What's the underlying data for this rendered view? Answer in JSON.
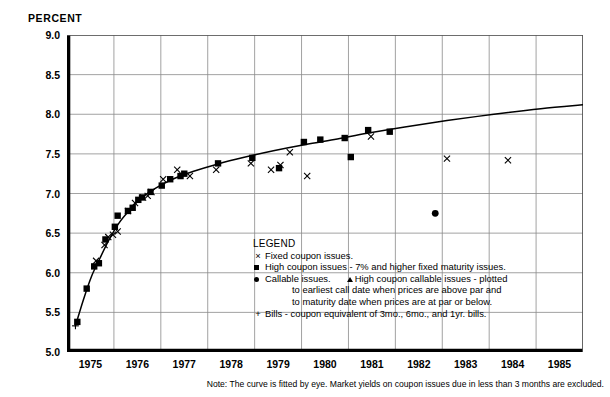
{
  "axis_caption": "PERCENT",
  "note": "Note: The curve is fitted by eye. Market yields on coupon issues due in less than 3 months are excluded.",
  "legend": {
    "title": "LEGEND",
    "items": [
      {
        "marker": "x-cross",
        "text": "Fixed coupon issues."
      },
      {
        "marker": "square",
        "text": "High coupon issues - 7% and higher fixed maturity issues."
      },
      {
        "marker": "circle",
        "text": "Callable issues."
      },
      {
        "marker": "triangle",
        "text": "High coupon callable issues - plotted"
      },
      {
        "marker": "none",
        "text": "to earliest call date when prices are above par and"
      },
      {
        "marker": "none",
        "text": "to maturity date when prices are at par or below."
      },
      {
        "marker": "plus",
        "text": "Bills - coupon equivalent of 3mo., 6mo., and 1yr. bills."
      }
    ]
  },
  "chart_data": {
    "type": "scatter",
    "title": "",
    "subtitle": "",
    "xlabel": "",
    "ylabel": "PERCENT",
    "xlim": [
      1975,
      1986
    ],
    "ylim": [
      5.0,
      9.0
    ],
    "grid": true,
    "legend_position": "inside-center-bottom",
    "yticks": [
      "9.0",
      "8.5",
      "8.0",
      "7.5",
      "7.0",
      "6.5",
      "6.0",
      "5.5",
      "5.0"
    ],
    "ytick_values": [
      9.0,
      8.5,
      8.0,
      7.5,
      7.0,
      6.5,
      6.0,
      5.5,
      5.0
    ],
    "xticks": [
      "1975",
      "1976",
      "1977",
      "1978",
      "1979",
      "1980",
      "1981",
      "1982",
      "1983",
      "1984",
      "1985"
    ],
    "xtick_values": [
      1975,
      1976,
      1977,
      1978,
      1979,
      1980,
      1981,
      1982,
      1983,
      1984,
      1985
    ],
    "series": [
      {
        "name": "Fixed coupon issues.",
        "marker": "x-cross",
        "points": [
          [
            1975.62,
            6.15
          ],
          [
            1975.8,
            6.35
          ],
          [
            1975.88,
            6.45
          ],
          [
            1975.98,
            6.48
          ],
          [
            1976.08,
            6.52
          ],
          [
            1976.3,
            6.78
          ],
          [
            1976.45,
            6.88
          ],
          [
            1976.62,
            6.95
          ],
          [
            1976.72,
            6.97
          ],
          [
            1976.8,
            7.02
          ],
          [
            1977.05,
            7.18
          ],
          [
            1977.35,
            7.3
          ],
          [
            1977.62,
            7.22
          ],
          [
            1978.18,
            7.3
          ],
          [
            1978.92,
            7.38
          ],
          [
            1979.35,
            7.3
          ],
          [
            1979.55,
            7.36
          ],
          [
            1979.75,
            7.52
          ],
          [
            1980.12,
            7.22
          ],
          [
            1981.48,
            7.72
          ],
          [
            1983.1,
            7.44
          ],
          [
            1984.4,
            7.42
          ]
        ]
      },
      {
        "name": "High coupon issues - 7% and higher fixed maturity issues.",
        "marker": "square",
        "points": [
          [
            1975.22,
            5.38
          ],
          [
            1975.42,
            5.8
          ],
          [
            1975.58,
            6.08
          ],
          [
            1975.68,
            6.12
          ],
          [
            1975.82,
            6.42
          ],
          [
            1976.02,
            6.58
          ],
          [
            1976.08,
            6.72
          ],
          [
            1976.3,
            6.78
          ],
          [
            1976.4,
            6.82
          ],
          [
            1976.52,
            6.92
          ],
          [
            1976.6,
            6.95
          ],
          [
            1976.78,
            7.02
          ],
          [
            1977.02,
            7.1
          ],
          [
            1977.2,
            7.18
          ],
          [
            1977.42,
            7.22
          ],
          [
            1977.5,
            7.25
          ],
          [
            1978.22,
            7.38
          ],
          [
            1978.95,
            7.45
          ],
          [
            1979.52,
            7.32
          ],
          [
            1980.05,
            7.65
          ],
          [
            1980.4,
            7.68
          ],
          [
            1980.92,
            7.7
          ],
          [
            1981.05,
            7.46
          ],
          [
            1981.42,
            7.8
          ],
          [
            1981.88,
            7.78
          ]
        ]
      },
      {
        "name": "Callable issues.",
        "marker": "circle",
        "points": [
          [
            1982.85,
            6.75
          ]
        ]
      },
      {
        "name": "High coupon callable issues",
        "marker": "triangle",
        "points": []
      },
      {
        "name": "Bills - coupon equivalent of 3mo., 6mo., and 1yr. bills.",
        "marker": "plus",
        "points": [
          [
            1975.18,
            5.33
          ]
        ]
      },
      {
        "name": "Fitted yield curve (fitted by eye)",
        "marker": "line",
        "points": [
          [
            1975.18,
            5.33
          ],
          [
            1975.35,
            5.66
          ],
          [
            1975.52,
            5.95
          ],
          [
            1975.7,
            6.18
          ],
          [
            1975.9,
            6.42
          ],
          [
            1976.1,
            6.62
          ],
          [
            1976.35,
            6.8
          ],
          [
            1976.6,
            6.95
          ],
          [
            1976.9,
            7.07
          ],
          [
            1977.25,
            7.18
          ],
          [
            1977.7,
            7.28
          ],
          [
            1978.2,
            7.37
          ],
          [
            1978.8,
            7.46
          ],
          [
            1979.4,
            7.54
          ],
          [
            1980.0,
            7.61
          ],
          [
            1980.7,
            7.68
          ],
          [
            1981.4,
            7.76
          ],
          [
            1982.2,
            7.84
          ],
          [
            1983.1,
            7.92
          ],
          [
            1984.1,
            8.0
          ],
          [
            1985.1,
            8.07
          ],
          [
            1986.0,
            8.12
          ]
        ]
      }
    ]
  }
}
